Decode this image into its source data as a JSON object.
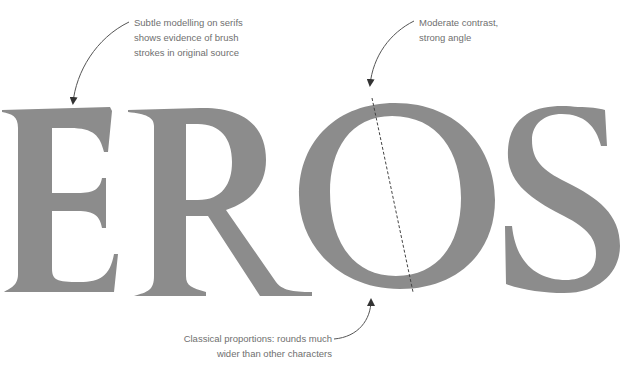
{
  "word": "EROS",
  "colors": {
    "letter_fill": "#8c8c8c",
    "annotation_text": "#6f6f6f",
    "arrow": "#555555",
    "background": "#ffffff"
  },
  "annotations": {
    "serifs": {
      "lines": [
        "Subtle modelling on serifs",
        "shows evidence of brush",
        "strokes in original source"
      ]
    },
    "contrast": {
      "lines": [
        "Moderate contrast,",
        "strong angle"
      ]
    },
    "proportions": {
      "lines": [
        "Classical proportions: rounds much",
        "wider than other characters"
      ]
    }
  }
}
